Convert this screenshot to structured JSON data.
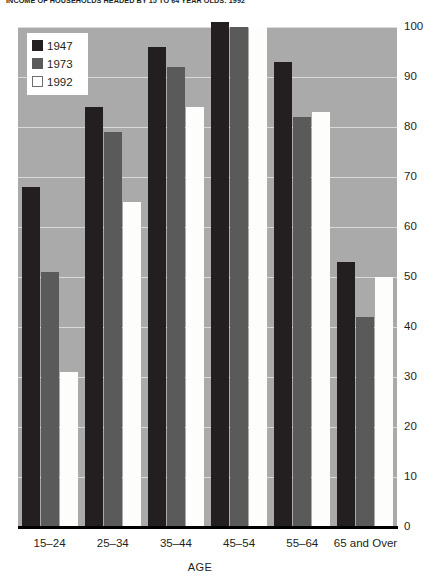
{
  "title": "INCOME OF HOUSEHOLDS HEADED BY 15 TO 64 YEAR OLDS: 1992",
  "axis": {
    "x_title": "AGE",
    "y_ticks": [
      "100",
      "90",
      "80",
      "70",
      "60",
      "50",
      "40",
      "30",
      "20",
      "10",
      "0"
    ]
  },
  "legend": {
    "items": [
      {
        "label": "1947",
        "color": "#231f20",
        "swatch": "swatch-1947"
      },
      {
        "label": "1973",
        "color": "#5a5a5a",
        "swatch": "swatch-1973"
      },
      {
        "label": "1992",
        "color": "#ffffff",
        "swatch": "swatch-1992"
      }
    ]
  },
  "colors": {
    "plot_background": "#aaaaaa",
    "gridline": "#d9d9d9",
    "axis": "#000000",
    "series_1947": "#231f20",
    "series_1973": "#5a5a5a",
    "series_1992": "#fdfdfb"
  },
  "chart_data": {
    "type": "bar",
    "title": "INCOME OF HOUSEHOLDS HEADED BY 15 TO 64 YEAR OLDS: 1992",
    "xlabel": "AGE",
    "ylabel": "",
    "ylim": [
      0,
      100
    ],
    "ytick_step": 10,
    "grid": true,
    "legend_position": "top-left",
    "categories": [
      "15–24",
      "25–34",
      "35–44",
      "45–54",
      "55–64",
      "65 and Over"
    ],
    "series": [
      {
        "name": "1947",
        "color": "#231f20",
        "values": [
          68,
          84,
          96,
          101,
          93,
          53
        ]
      },
      {
        "name": "1973",
        "color": "#5a5a5a",
        "values": [
          51,
          79,
          92,
          100,
          82,
          42
        ]
      },
      {
        "name": "1992",
        "color": "#fdfdfb",
        "values": [
          31,
          65,
          84,
          100,
          83,
          50
        ]
      }
    ]
  }
}
